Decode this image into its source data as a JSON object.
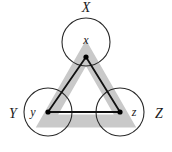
{
  "figure": {
    "title": "",
    "colors": {
      "background": "#ffffff",
      "circle_stroke": "#2b2b2b",
      "grey_band": "#c9c9c9",
      "black_line": "#111111",
      "point_fill": "#000000",
      "text": "#1a1a1a"
    },
    "geometry": {
      "circle_radius": 24,
      "grey_band_width": 13,
      "black_line_width": 1.8,
      "point_radius": 2.6
    },
    "sets": [
      {
        "id": "X",
        "set_label": "X",
        "set_label_pos": {
          "x": 86,
          "y": 12
        },
        "circle": {
          "cx": 86,
          "cy": 42,
          "r": 24
        },
        "point_label": "x",
        "point_label_pos": {
          "x": 86,
          "y": 44
        },
        "point": {
          "x": 86,
          "y": 57
        }
      },
      {
        "id": "Y",
        "set_label": "Y",
        "set_label_pos": {
          "x": 13,
          "y": 118
        },
        "circle": {
          "cx": 48,
          "cy": 112,
          "r": 24
        },
        "point_label": "y",
        "point_label_pos": {
          "x": 33,
          "y": 116
        },
        "point": {
          "x": 48,
          "y": 112
        }
      },
      {
        "id": "Z",
        "set_label": "Z",
        "set_label_pos": {
          "x": 159,
          "y": 118
        },
        "circle": {
          "cx": 120,
          "cy": 112,
          "r": 24
        },
        "point_label": "z",
        "point_label_pos": {
          "x": 134,
          "y": 116
        },
        "point": {
          "x": 120,
          "y": 112
        }
      }
    ],
    "grey_triangle": {
      "vertices": [
        {
          "x": 86,
          "y": 53
        },
        {
          "x": 47,
          "y": 121
        },
        {
          "x": 125,
          "y": 121
        }
      ]
    },
    "black_triangle": {
      "edges": [
        {
          "from": "x",
          "to": "y"
        },
        {
          "from": "x",
          "to": "z"
        },
        {
          "from": "y",
          "to": "z"
        }
      ]
    }
  }
}
